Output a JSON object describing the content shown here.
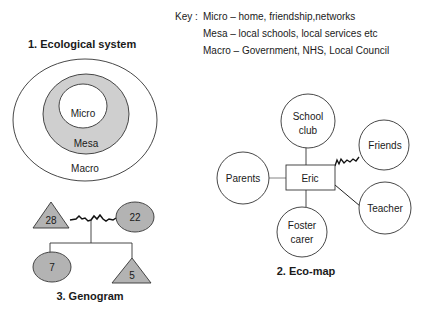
{
  "key": {
    "prefix": "Key :",
    "lines": [
      "Micro – home, friendship,networks",
      "Mesa – local schools, local services etc",
      "Macro – Government, NHS, Local Council"
    ]
  },
  "ecological_system": {
    "title": "1. Ecological system",
    "layers": {
      "micro": "Micro",
      "mesa": "Mesa",
      "macro": "Macro"
    },
    "colors": {
      "mesa_fill": "#cfcfcf",
      "stroke": "#333333"
    }
  },
  "eco_map": {
    "title": "2. Eco-map",
    "center": "Eric",
    "nodes": {
      "school_club": [
        "School",
        "club"
      ],
      "friends": "Friends",
      "parents": "Parents",
      "teacher": "Teacher",
      "foster_carer": [
        "Foster",
        "carer"
      ]
    }
  },
  "genogram": {
    "title": "3. Genogram",
    "father_age": "28",
    "mother_age": "22",
    "daughter_age": "7",
    "son_age": "5",
    "colors": {
      "fill": "#b3b3b3"
    }
  }
}
